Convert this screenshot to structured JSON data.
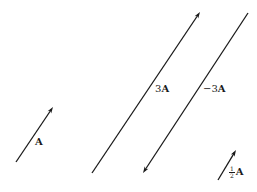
{
  "figure": {
    "colors": {
      "line": "#1a1a1a",
      "background": "#ffffff"
    },
    "vectors": [
      {
        "id": "A",
        "label_scalar": "",
        "label_vector": "A",
        "tail": [
          16,
          162
        ],
        "tip": [
          53,
          107
        ],
        "label_pos": [
          35,
          137
        ]
      },
      {
        "id": "3A",
        "label_scalar": "3",
        "label_vector": "A",
        "tail": [
          92,
          173
        ],
        "tip": [
          200,
          12
        ],
        "label_pos": [
          155,
          84
        ]
      },
      {
        "id": "neg-3A",
        "label_scalar": "−3",
        "label_vector": "A",
        "tail": [
          248,
          13
        ],
        "tip": [
          143,
          173
        ],
        "label_pos": [
          203,
          84
        ]
      },
      {
        "id": "half-A",
        "label_scalar_num": "1",
        "label_scalar_den": "2",
        "label_vector": "A",
        "tail": [
          218,
          180
        ],
        "tip": [
          236,
          150
        ],
        "label_pos": [
          229,
          166
        ]
      }
    ]
  }
}
